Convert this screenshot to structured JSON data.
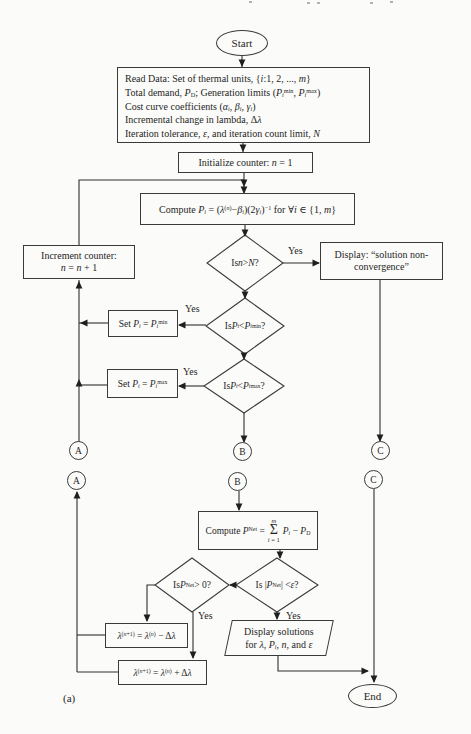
{
  "palette": {
    "ink": "#3a3a3a",
    "paper": "#fbfbf9"
  },
  "flowchart": {
    "caption": "(a)",
    "start": {
      "label": "Start"
    },
    "end": {
      "label": "End"
    },
    "read_data": {
      "lines": [
        "Read Data: Set of thermal units, {*i*:1, 2, ..., *m*}",
        "Total demand, *P*~D~; Generation limits (*P*~*i*~^min^, *P*~*i*~^max^)",
        "Cost curve coefficients (*α*~*i*~, *β*~*i*~, *γ*~*i*~)",
        "Incremental change in lambda, Δ*λ*",
        "Iteration tolerance, *ε*, and iteration count limit, *N*"
      ]
    },
    "initialize": {
      "label": "Initialize counter: *n* = 1"
    },
    "compute_pi": {
      "label": "Compute *P*~*i*~ = (*λ*^(*n*)^−*β*~*i*~)(2*γ*~*i*~)^−1^ for ∀*i* ∈ {1, *m*}"
    },
    "decision_iteration": {
      "label": "Is *n* > *N*?"
    },
    "display_nonconvergence": {
      "lines": [
        "Display: “solution non-",
        "convergence”"
      ]
    },
    "increment": {
      "lines": [
        "Increment counter:",
        "*n* = *n* + 1"
      ]
    },
    "decision_pmin": {
      "label": "Is *P*~*i*~ < *P*~*i*~^min^ ?"
    },
    "set_pmin": {
      "label": "Set *P*~*i*~ = *P*~*i*~^min^"
    },
    "decision_pmax": {
      "label": "Is *P*~*i*~ < *P*~*i*~^max^ ?"
    },
    "set_pmax": {
      "label": "Set *P*~*i*~ = *P*~*i*~^max^"
    },
    "connector_labels": {
      "a": "A",
      "b": "B",
      "c": "C"
    },
    "compute_pnet": {
      "prefix": "Compute *P*^Net^ =",
      "sigma": "Σ",
      "sum_upper": "*m*",
      "sum_lower": "*i* = 1",
      "suffix": "*P*~*i*~ − *P*~D~"
    },
    "decision_pnet_positive": {
      "label": "Is *P*^Net^ > 0?"
    },
    "decision_tolerance": {
      "label": "Is |*P*^Net^| < *ε*?"
    },
    "lambda_decrease": {
      "label": "*λ*^(*n*+1)^ = *λ*^(*n*)^ − Δ*λ*"
    },
    "lambda_increase": {
      "label": "*λ*^(*n*+1)^ = *λ*^(*n*)^ + Δ*λ*"
    },
    "display_solutions": {
      "lines": [
        "Display solutions",
        "for *λ*, *P*~*i*~, *n*, and *ε*"
      ]
    },
    "branch_labels": {
      "iteration_yes": "Yes",
      "pmin_yes": "Yes",
      "pmax_yes": "Yes",
      "pnet_yes": "Yes",
      "tolerance_yes": "Yes"
    }
  }
}
